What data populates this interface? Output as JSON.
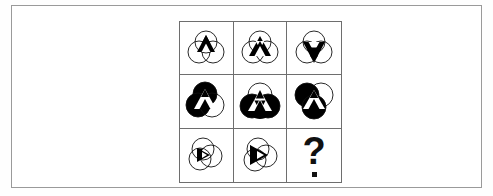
{
  "page": {
    "background_color": "#fefefe",
    "frame_border_color": "#9a9a9a"
  },
  "puzzle": {
    "type": "visual-analogy-matrix",
    "rows": 3,
    "columns": 3,
    "grid_border_color": "#6e6e6e",
    "fill_color": "#000000",
    "stroke_color": "#111111",
    "missing_cell": "row3-col3",
    "missing_cell_symbol": "?",
    "cells": [
      {
        "id": "row1-col1",
        "row": 1,
        "col": 1,
        "description": "Three overlapping outline circles with a small black upward triangle and white inner triangle at the top-center overlap",
        "circle_radius": 11,
        "circles_filled": [],
        "triangle_scale": 0.58,
        "triangle_orientation": "up",
        "motif": "small-triangle-top"
      },
      {
        "id": "row1-col2",
        "row": 1,
        "col": 2,
        "description": "Three overlapping outline circles with a medium black upward triangle and white inner triangle centred low",
        "circle_radius": 11,
        "circles_filled": [],
        "triangle_scale": 0.72,
        "triangle_orientation": "up",
        "motif": "medium-triangle-center"
      },
      {
        "id": "row1-col3",
        "row": 1,
        "col": 3,
        "description": "Three overlapping outline circles with a black downward triangle and white inner triangle",
        "circle_radius": 11,
        "circles_filled": [],
        "triangle_scale": 0.78,
        "triangle_orientation": "down",
        "motif": "triangle-down"
      },
      {
        "id": "row2-col1",
        "row": 2,
        "col": 1,
        "description": "Three overlapping circles, upper-left and lower-left filled black, with white triangle cutouts",
        "circle_radius": 12,
        "circles_filled": [
          "top",
          "left"
        ],
        "triangle_scale": 0.8,
        "triangle_orientation": "up",
        "motif": "two-circles-filled"
      },
      {
        "id": "row2-col2",
        "row": 2,
        "col": 2,
        "description": "Three overlapping circles all filled black except the top cap, with white triangle cutouts",
        "circle_radius": 12,
        "circles_filled": [
          "left",
          "right",
          "bottom"
        ],
        "triangle_scale": 0.86,
        "triangle_orientation": "up",
        "motif": "three-circles-filled"
      },
      {
        "id": "row2-col3",
        "row": 2,
        "col": 3,
        "description": "Three overlapping circles, left and bottom filled black, right circle outline, white triangle cutouts",
        "circle_radius": 12,
        "circles_filled": [
          "left",
          "bottom"
        ],
        "triangle_scale": 0.8,
        "triangle_orientation": "up",
        "motif": "two-circles-filled-right-open"
      },
      {
        "id": "row3-col1",
        "row": 3,
        "col": 1,
        "description": "Three overlapping outline circles with a small black right-pointing triangle and white inner triangle at the left",
        "circle_radius": 11,
        "circles_filled": [],
        "triangle_scale": 0.5,
        "triangle_orientation": "right",
        "motif": "small-triangle-left"
      },
      {
        "id": "row3-col2",
        "row": 3,
        "col": 2,
        "description": "Three overlapping outline circles with a medium black right-pointing triangle and white inner triangle at the centre-left",
        "circle_radius": 11,
        "circles_filled": [],
        "triangle_scale": 0.62,
        "triangle_orientation": "right",
        "motif": "medium-triangle-left"
      },
      {
        "id": "row3-col3",
        "row": 3,
        "col": 3,
        "description": "Empty answer cell showing a bold question mark",
        "motif": "question-mark"
      }
    ]
  }
}
